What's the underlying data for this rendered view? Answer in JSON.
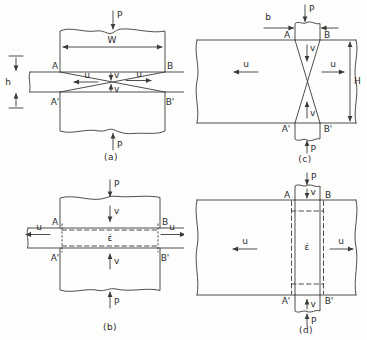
{
  "colors": {
    "ink": "#3a3a3a",
    "paper": "#fdfdfc"
  },
  "panels": {
    "a": {
      "caption": "(a)",
      "force_top": "P",
      "force_bottom": "P",
      "width": "W",
      "thickness": "h",
      "corner_tl": "A",
      "corner_tr": "B",
      "corner_bl": "A'",
      "corner_br": "B'",
      "u_left": "u",
      "u_right": "u",
      "v_top": "v",
      "v_bottom": "v"
    },
    "b": {
      "caption": "(b)",
      "force_top": "P",
      "force_bottom": "P",
      "strain_rate": "ε̇",
      "corner_tl": "A",
      "corner_tr": "B",
      "corner_bl": "A'",
      "corner_br": "B'",
      "u_left": "u",
      "u_right": "u",
      "v_top": "v",
      "v_bottom": "v"
    },
    "c": {
      "caption": "(c)",
      "force_top": "P",
      "force_bottom": "P",
      "punch_width": "b",
      "plate_height": "H",
      "corner_tl": "A",
      "corner_tr": "B",
      "corner_bl": "A'",
      "corner_br": "B'",
      "u_left": "u",
      "u_right": "u",
      "v_top": "v",
      "v_bottom": "v"
    },
    "d": {
      "caption": "(d)",
      "force_top": "P",
      "force_bottom": "P",
      "strain_rate": "ε̇",
      "corner_tl": "A",
      "corner_tr": "B",
      "corner_bl": "A'",
      "corner_br": "B'",
      "u_left": "u",
      "u_right": "u",
      "v_top": "v",
      "v_bottom": "v"
    }
  }
}
